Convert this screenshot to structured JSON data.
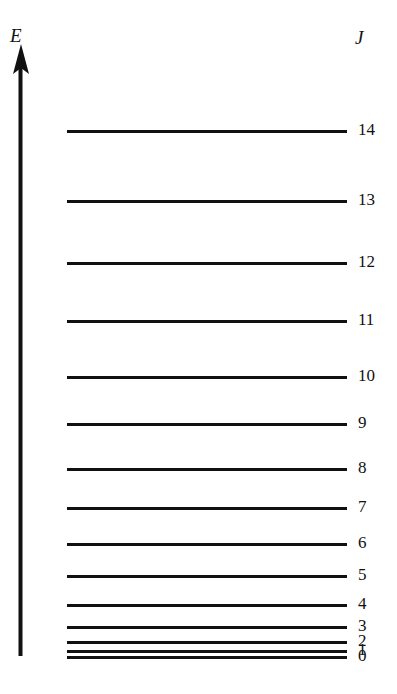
{
  "figure": {
    "axis": {
      "energy_label": "E",
      "column_label": "J",
      "direction": "up",
      "color": "#111111"
    },
    "levels": [
      {
        "j": "14",
        "y": 130,
        "x_start": 67,
        "x_end": 347,
        "label_x": 358
      },
      {
        "j": "13",
        "y": 200,
        "x_start": 67,
        "x_end": 347,
        "label_x": 358
      },
      {
        "j": "12",
        "y": 262,
        "x_start": 67,
        "x_end": 347,
        "label_x": 358
      },
      {
        "j": "11",
        "y": 320,
        "x_start": 67,
        "x_end": 347,
        "label_x": 358
      },
      {
        "j": "10",
        "y": 376,
        "x_start": 67,
        "x_end": 347,
        "label_x": 358
      },
      {
        "j": "9",
        "y": 423,
        "x_start": 67,
        "x_end": 347,
        "label_x": 358
      },
      {
        "j": "8",
        "y": 468,
        "x_start": 67,
        "x_end": 347,
        "label_x": 358
      },
      {
        "j": "7",
        "y": 507,
        "x_start": 67,
        "x_end": 347,
        "label_x": 358
      },
      {
        "j": "6",
        "y": 543,
        "x_start": 67,
        "x_end": 347,
        "label_x": 358
      },
      {
        "j": "5",
        "y": 575,
        "x_start": 67,
        "x_end": 347,
        "label_x": 358
      },
      {
        "j": "4",
        "y": 604,
        "x_start": 67,
        "x_end": 347,
        "label_x": 358
      },
      {
        "j": "3",
        "y": 626,
        "x_start": 67,
        "x_end": 347,
        "label_x": 358
      },
      {
        "j": "2",
        "y": 641,
        "x_start": 67,
        "x_end": 347,
        "label_x": 358
      },
      {
        "j": "1",
        "y": 650,
        "x_start": 67,
        "x_end": 347,
        "label_x": 358
      },
      {
        "j": "0",
        "y": 656,
        "x_start": 67,
        "x_end": 347,
        "label_x": 358
      }
    ]
  },
  "chart_data": {
    "type": "line",
    "title": "",
    "subtitle": "",
    "xlabel": "",
    "ylabel": "E",
    "legend": [],
    "grid": false,
    "categories": [
      "0",
      "1",
      "2",
      "3",
      "4",
      "5",
      "6",
      "7",
      "8",
      "9",
      "10",
      "11",
      "12",
      "13",
      "14"
    ],
    "series": [
      {
        "name": "level y-position (px from top)",
        "values": [
          656,
          650,
          641,
          626,
          604,
          575,
          543,
          507,
          468,
          423,
          376,
          320,
          262,
          200,
          130
        ]
      },
      {
        "name": "relative energy  J(J+1)",
        "values": [
          0,
          2,
          6,
          12,
          20,
          30,
          42,
          56,
          72,
          90,
          110,
          132,
          156,
          182,
          210
        ]
      }
    ],
    "axis_labels": {
      "y_axis_arrow": "E",
      "level_column": "J"
    },
    "ylim": [
      0,
      210
    ]
  }
}
